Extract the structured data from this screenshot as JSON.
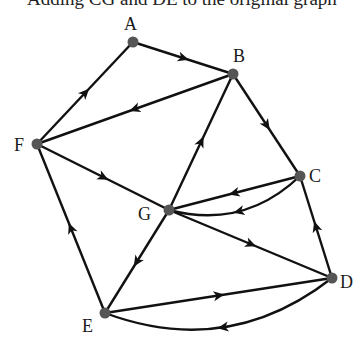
{
  "caption": "Adding CG and DE to the original graph",
  "colors": {
    "edge": "#111111",
    "node": "#555555",
    "label": "#1a1a1a"
  },
  "nodes": [
    {
      "id": "A",
      "label": "A",
      "x": 133,
      "y": 42,
      "lx": 124,
      "ly": 30
    },
    {
      "id": "B",
      "label": "B",
      "x": 233,
      "y": 74,
      "lx": 233,
      "ly": 62
    },
    {
      "id": "C",
      "label": "C",
      "x": 300,
      "y": 176,
      "lx": 309,
      "ly": 182
    },
    {
      "id": "D",
      "label": "D",
      "x": 332,
      "y": 278,
      "lx": 340,
      "ly": 288
    },
    {
      "id": "E",
      "label": "E",
      "x": 105,
      "y": 313,
      "lx": 82,
      "ly": 332
    },
    {
      "id": "F",
      "label": "F",
      "x": 37,
      "y": 144,
      "lx": 14,
      "ly": 151
    },
    {
      "id": "G",
      "label": "G",
      "x": 169,
      "y": 210,
      "lx": 138,
      "ly": 220
    }
  ],
  "edges": [
    {
      "from": "F",
      "to": "A",
      "curve": 0
    },
    {
      "from": "A",
      "to": "B",
      "curve": 0
    },
    {
      "from": "B",
      "to": "F",
      "curve": 0
    },
    {
      "from": "F",
      "to": "G",
      "curve": 0
    },
    {
      "from": "E",
      "to": "F",
      "curve": 0
    },
    {
      "from": "G",
      "to": "B",
      "curve": 0
    },
    {
      "from": "B",
      "to": "C",
      "curve": 0
    },
    {
      "from": "C",
      "to": "G",
      "curve": 0
    },
    {
      "from": "C",
      "to": "G",
      "curve": 1
    },
    {
      "from": "D",
      "to": "C",
      "curve": 0
    },
    {
      "from": "G",
      "to": "D",
      "curve": 0
    },
    {
      "from": "G",
      "to": "E",
      "curve": 0
    },
    {
      "from": "E",
      "to": "D",
      "curve": 0
    },
    {
      "from": "D",
      "to": "E",
      "curve": 1
    }
  ]
}
